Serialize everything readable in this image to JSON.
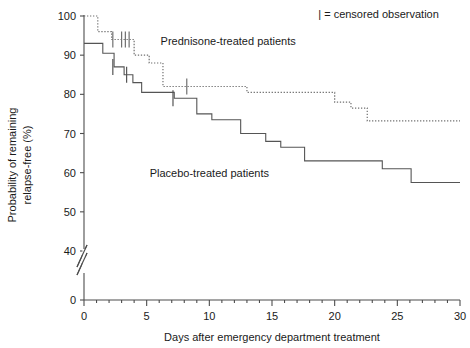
{
  "chart_data": {
    "type": "line",
    "subtype": "kaplan-meier-step",
    "title": "",
    "xlabel": "Days after emergency department treatment",
    "ylabel": "Probability of remaining relapse-free (%)",
    "xlim": [
      0,
      30
    ],
    "ylim": [
      35,
      100
    ],
    "y_axis_break": {
      "present": true,
      "between": [
        40,
        0
      ],
      "zero_tick_shown": 0
    },
    "grid": false,
    "legend": {
      "position": "top-right",
      "entries": [
        "| = censored observation"
      ]
    },
    "xticks_major": [
      0,
      5,
      10,
      15,
      20,
      25,
      30
    ],
    "xtick_labels": [
      "0",
      "5",
      "10",
      "15",
      "20",
      "25",
      "30"
    ],
    "xticks_minor_step": 1,
    "yticks": [
      100,
      90,
      80,
      70,
      60,
      50,
      40,
      0
    ],
    "ytick_labels": [
      "100",
      "90",
      "80",
      "70",
      "60",
      "50",
      "40",
      "0"
    ],
    "annotations": [
      {
        "text": "Prednisone-treated patients",
        "x_day": 11.5,
        "y_pct": 92.5
      },
      {
        "text": "Placebo-treated patients",
        "x_day": 10.0,
        "y_pct": 59.0
      },
      {
        "text": "| = censored observation",
        "x_day": 23.5,
        "y_pct": 99.5
      }
    ],
    "series": [
      {
        "name": "Prednisone-treated patients",
        "style": "dotted",
        "color": "#707070",
        "steps": [
          {
            "day": 0.0,
            "value": 100.0
          },
          {
            "day": 1.1,
            "value": 100.0
          },
          {
            "day": 1.1,
            "value": 96.0
          },
          {
            "day": 2.2,
            "value": 96.0
          },
          {
            "day": 2.2,
            "value": 94.0
          },
          {
            "day": 4.0,
            "value": 94.0
          },
          {
            "day": 4.0,
            "value": 90.0
          },
          {
            "day": 5.2,
            "value": 90.0
          },
          {
            "day": 5.2,
            "value": 88.0
          },
          {
            "day": 6.3,
            "value": 88.0
          },
          {
            "day": 6.3,
            "value": 82.0
          },
          {
            "day": 13.0,
            "value": 82.0
          },
          {
            "day": 13.0,
            "value": 80.5
          },
          {
            "day": 20.0,
            "value": 80.5
          },
          {
            "day": 20.0,
            "value": 78.0
          },
          {
            "day": 21.3,
            "value": 78.0
          },
          {
            "day": 21.3,
            "value": 76.5
          },
          {
            "day": 22.6,
            "value": 76.5
          },
          {
            "day": 22.6,
            "value": 73.2
          },
          {
            "day": 30.0,
            "value": 73.2
          }
        ],
        "censored": [
          {
            "day": 2.3,
            "value": 94.0
          },
          {
            "day": 3.0,
            "value": 94.0
          },
          {
            "day": 3.3,
            "value": 94.0
          },
          {
            "day": 3.6,
            "value": 94.0
          },
          {
            "day": 8.2,
            "value": 82.0
          }
        ]
      },
      {
        "name": "Placebo-treated patients",
        "style": "solid",
        "color": "#555555",
        "steps": [
          {
            "day": 0.0,
            "value": 93.0
          },
          {
            "day": 1.5,
            "value": 93.0
          },
          {
            "day": 1.5,
            "value": 90.5
          },
          {
            "day": 2.4,
            "value": 90.5
          },
          {
            "day": 2.4,
            "value": 87.0
          },
          {
            "day": 3.2,
            "value": 87.0
          },
          {
            "day": 3.2,
            "value": 85.0
          },
          {
            "day": 3.9,
            "value": 85.0
          },
          {
            "day": 3.9,
            "value": 83.0
          },
          {
            "day": 4.6,
            "value": 83.0
          },
          {
            "day": 4.6,
            "value": 80.5
          },
          {
            "day": 7.2,
            "value": 80.5
          },
          {
            "day": 7.2,
            "value": 79.0
          },
          {
            "day": 9.0,
            "value": 79.0
          },
          {
            "day": 9.0,
            "value": 75.0
          },
          {
            "day": 10.2,
            "value": 75.0
          },
          {
            "day": 10.2,
            "value": 73.5
          },
          {
            "day": 12.5,
            "value": 73.5
          },
          {
            "day": 12.5,
            "value": 70.0
          },
          {
            "day": 14.5,
            "value": 70.0
          },
          {
            "day": 14.5,
            "value": 68.0
          },
          {
            "day": 15.7,
            "value": 68.0
          },
          {
            "day": 15.7,
            "value": 66.5
          },
          {
            "day": 17.6,
            "value": 66.5
          },
          {
            "day": 17.6,
            "value": 63.0
          },
          {
            "day": 23.8,
            "value": 63.0
          },
          {
            "day": 23.8,
            "value": 61.0
          },
          {
            "day": 26.1,
            "value": 61.0
          },
          {
            "day": 26.1,
            "value": 57.5
          },
          {
            "day": 30.0,
            "value": 57.5
          }
        ],
        "censored": [
          {
            "day": 2.3,
            "value": 87.0
          },
          {
            "day": 3.4,
            "value": 85.0
          },
          {
            "day": 7.1,
            "value": 79.0
          }
        ]
      }
    ]
  }
}
